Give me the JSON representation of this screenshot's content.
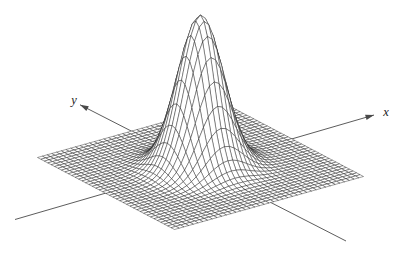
{
  "figure": {
    "background_color": "#ffffff",
    "mesh_line_color": "#161616",
    "mesh_fill_color": "#ffffff",
    "axis_line_color": "#4a4a4a",
    "label_color": "#1a1a1a"
  },
  "chart_data": {
    "type": "surface",
    "subtype": "3d-wireframe-mesh",
    "function": "z = exp(-(x^2 + y^2) / 2)",
    "x_range": [
      -5,
      5
    ],
    "y_range": [
      -5,
      5
    ],
    "z_range": [
      0,
      1
    ],
    "grid_divisions": 40,
    "peak": {
      "x": 0,
      "y": 0,
      "z": 1
    },
    "xlabel": "x",
    "ylabel": "y",
    "axes": {
      "x_arrow": "positive-end",
      "y_arrow": "positive-end",
      "ticks": "none"
    },
    "legend": "none",
    "title": ""
  }
}
